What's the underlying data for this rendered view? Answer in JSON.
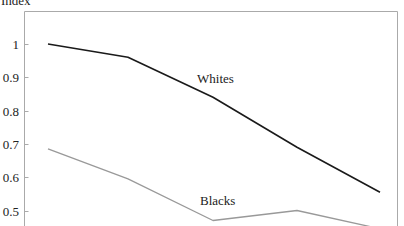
{
  "chart_data": {
    "type": "line",
    "title": "",
    "xlabel": "",
    "ylabel": "Index",
    "ylim": [
      0.45,
      1.1
    ],
    "yticks": [
      1,
      0.9,
      0.8,
      0.7,
      0.6,
      0.5
    ],
    "ytick_labels": [
      "1",
      "0.9",
      "0.8",
      "0.7",
      "0.6",
      "0.5"
    ],
    "grid": false,
    "legend": "inline labels",
    "x": [
      1,
      2,
      3,
      4,
      5
    ],
    "series": [
      {
        "name": "Whites",
        "color": "#1a1a1a",
        "values": [
          1.0,
          0.96,
          0.84,
          0.69,
          0.555
        ]
      },
      {
        "name": "Blacks",
        "color": "#999999",
        "values": [
          0.685,
          0.595,
          0.47,
          0.5,
          0.445
        ]
      }
    ]
  }
}
